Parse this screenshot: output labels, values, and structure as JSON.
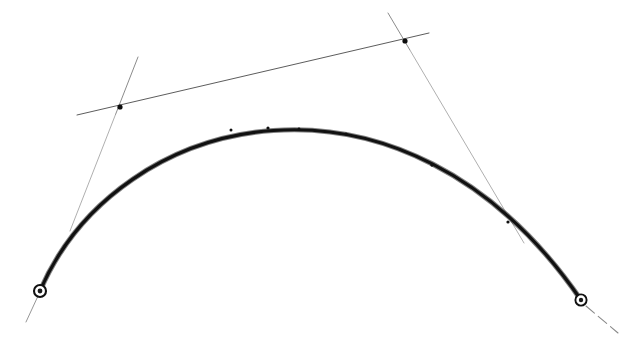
{
  "figure": {
    "title": "Bezier curve with control polygon and tangent handles",
    "background_color": "#ffffff",
    "width": 625,
    "height": 345,
    "ink_color": "#111111",
    "guide_color": "#6d6d6d",
    "faint_guide_color": "#9a9a9a"
  },
  "chart_data": {
    "type": "line",
    "title": "Bezier curve with control polygon and tangent handles",
    "xlabel": "",
    "ylabel": "",
    "xlim": [
      0,
      625
    ],
    "ylim": [
      345,
      0
    ],
    "grid": false,
    "legend": "none",
    "series": [
      {
        "name": "bezier-curve",
        "kind": "cubic-bezier",
        "stroke_width": 3.2,
        "color": "#111111",
        "control_points": [
          [
            40,
            291
          ],
          [
            118,
            109
          ],
          [
            404,
            42
          ],
          [
            581,
            300
          ]
        ],
        "sampled_points": [
          [
            40,
            291
          ],
          [
            62,
            244
          ],
          [
            88,
            203
          ],
          [
            118,
            171
          ],
          [
            152,
            151
          ],
          [
            190,
            138
          ],
          [
            232,
            131
          ],
          [
            276,
            128
          ],
          [
            320,
            130
          ],
          [
            362,
            137
          ],
          [
            402,
            150
          ],
          [
            440,
            170
          ],
          [
            474,
            196
          ],
          [
            508,
            228
          ],
          [
            540,
            262
          ],
          [
            565,
            285
          ],
          [
            581,
            300
          ]
        ]
      }
    ],
    "annotations": [
      {
        "name": "left-endpoint-node",
        "type": "ring-node",
        "x": 40,
        "y": 291,
        "outer_radius": 6.0,
        "inner_radius": 2.4
      },
      {
        "name": "right-endpoint-node",
        "type": "ring-node",
        "x": 581,
        "y": 300,
        "outer_radius": 5.6,
        "inner_radius": 2.2
      },
      {
        "name": "left-control-dot",
        "type": "dot",
        "x": 120,
        "y": 107,
        "radius": 2.6
      },
      {
        "name": "right-control-dot",
        "type": "dot",
        "x": 405,
        "y": 41,
        "radius": 2.6
      }
    ],
    "guides": [
      {
        "name": "control-polygon-chord",
        "type": "segment",
        "from": [
          77,
          115
        ],
        "to": [
          429,
          33
        ],
        "stroke_width": 0.9,
        "color": "#4a4a4a"
      },
      {
        "name": "left-tangent-handle",
        "type": "segment",
        "from": [
          138,
          57
        ],
        "to": [
          70,
          231
        ],
        "stroke_width": 0.8,
        "color": "#7d7d7d"
      },
      {
        "name": "right-tangent-handle",
        "type": "segment",
        "from": [
          388,
          13
        ],
        "to": [
          524,
          243
        ],
        "stroke_width": 0.8,
        "color": "#7d7d7d"
      },
      {
        "name": "left-endpoint-tail",
        "type": "segment",
        "from": [
          38,
          296
        ],
        "to": [
          26,
          322
        ],
        "stroke_width": 0.9,
        "color": "#8a8a8a"
      },
      {
        "name": "right-endpoint-tail",
        "type": "dashed-segment",
        "from": [
          586,
          306
        ],
        "to": [
          618,
          333
        ],
        "stroke_width": 1.1,
        "color": "#8a8a8a"
      }
    ],
    "curve_ticks": [
      [
        231,
        130
      ],
      [
        268,
        128
      ],
      [
        299,
        129
      ],
      [
        346,
        134
      ],
      [
        432,
        165
      ],
      [
        508,
        222
      ]
    ]
  }
}
